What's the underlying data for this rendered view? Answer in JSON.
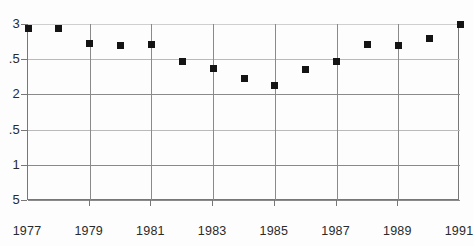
{
  "chart_data": {
    "type": "scatter",
    "title": "",
    "subtitle": "",
    "xlabel": "",
    "ylabel": "",
    "xlim": [
      1977,
      1991
    ],
    "ylim": [
      0.5,
      3.0
    ],
    "grid": true,
    "legend": null,
    "marker": "filled-square",
    "marker_color": "#141414",
    "axis_color": "#777777",
    "grid_color": "#8a8a8a",
    "background": "#ffffff",
    "x_tick_labels": [
      "1977",
      "1979",
      "1981",
      "1983",
      "1985",
      "1987",
      "1989",
      "1991"
    ],
    "x_tick_values": [
      1977,
      1979,
      1981,
      1983,
      1985,
      1987,
      1989,
      1991
    ],
    "y_tick_labels": [
      "3",
      ".5",
      "2",
      ".5",
      "1",
      "5"
    ],
    "y_tick_values": [
      3.0,
      2.5,
      2.0,
      1.5,
      1.0,
      0.5
    ],
    "x": [
      1977,
      1978,
      1979,
      1980,
      1981,
      1982,
      1983,
      1984,
      1985,
      1986,
      1987,
      1988,
      1989,
      1990,
      1991
    ],
    "values": [
      2.93,
      2.93,
      2.73,
      2.7,
      2.71,
      2.47,
      2.37,
      2.23,
      2.12,
      2.35,
      2.47,
      2.71,
      2.7,
      2.79,
      3.0
    ],
    "points": [
      {
        "x": 1977,
        "y": 2.93
      },
      {
        "x": 1978,
        "y": 2.93
      },
      {
        "x": 1979,
        "y": 2.73
      },
      {
        "x": 1980,
        "y": 2.7
      },
      {
        "x": 1981,
        "y": 2.71
      },
      {
        "x": 1982,
        "y": 2.47
      },
      {
        "x": 1983,
        "y": 2.37
      },
      {
        "x": 1984,
        "y": 2.23
      },
      {
        "x": 1985,
        "y": 2.12
      },
      {
        "x": 1986,
        "y": 2.35
      },
      {
        "x": 1987,
        "y": 2.47
      },
      {
        "x": 1988,
        "y": 2.71
      },
      {
        "x": 1989,
        "y": 2.7
      },
      {
        "x": 1990,
        "y": 2.79
      },
      {
        "x": 1991,
        "y": 3.0
      }
    ]
  }
}
